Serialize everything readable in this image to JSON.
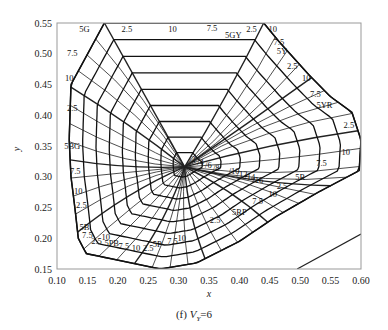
{
  "chart_data": {
    "type": "line",
    "title": "",
    "caption_prefix": "(f)",
    "caption_var": "V",
    "caption_sub": "Y",
    "caption_suffix": "=6",
    "xlabel": "x",
    "ylabel": "y",
    "xlim": [
      0.1,
      0.6
    ],
    "ylim": [
      0.15,
      0.55
    ],
    "x_ticks": [
      "0.10",
      "0.15",
      "0.20",
      "0.25",
      "0.30",
      "0.35",
      "0.40",
      "0.45",
      "0.50",
      "0.55",
      "0.60"
    ],
    "y_ticks": [
      "0.15",
      "0.20",
      "0.25",
      "0.30",
      "0.35",
      "0.40",
      "0.45",
      "0.50",
      "0.55"
    ],
    "grid": false,
    "white_point": {
      "x": 0.31,
      "y": 0.316
    },
    "chroma_labels": [
      "/2",
      "/4",
      "/6",
      "/8",
      "/10",
      "/12",
      "/14",
      "/16"
    ],
    "hue_labels": [
      {
        "text": "5G",
        "x": 0.145,
        "y": 0.535
      },
      {
        "text": "7.5",
        "x": 0.125,
        "y": 0.497
      },
      {
        "text": "10",
        "x": 0.12,
        "y": 0.456
      },
      {
        "text": "2.5",
        "x": 0.125,
        "y": 0.407
      },
      {
        "text": "5BG",
        "x": 0.125,
        "y": 0.345
      },
      {
        "text": "7.5",
        "x": 0.13,
        "y": 0.305
      },
      {
        "text": "10",
        "x": 0.135,
        "y": 0.272
      },
      {
        "text": "2.5",
        "x": 0.14,
        "y": 0.25
      },
      {
        "text": "5B",
        "x": 0.145,
        "y": 0.213
      },
      {
        "text": "7.5",
        "x": 0.15,
        "y": 0.2
      },
      {
        "text": "2.5",
        "x": 0.165,
        "y": 0.19
      },
      {
        "text": "10",
        "x": 0.18,
        "y": 0.197
      },
      {
        "text": "5PB",
        "x": 0.19,
        "y": 0.187
      },
      {
        "text": "7.5",
        "x": 0.21,
        "y": 0.183
      },
      {
        "text": "10",
        "x": 0.23,
        "y": 0.18
      },
      {
        "text": "2.5",
        "x": 0.25,
        "y": 0.18
      },
      {
        "text": "5P",
        "x": 0.265,
        "y": 0.185
      },
      {
        "text": "7.5",
        "x": 0.29,
        "y": 0.19
      },
      {
        "text": "10",
        "x": 0.305,
        "y": 0.195
      },
      {
        "text": "2.5",
        "x": 0.36,
        "y": 0.225
      },
      {
        "text": "5RP",
        "x": 0.4,
        "y": 0.238
      },
      {
        "text": "7.5",
        "x": 0.43,
        "y": 0.255
      },
      {
        "text": "10",
        "x": 0.455,
        "y": 0.267
      },
      {
        "text": "2.5",
        "x": 0.47,
        "y": 0.28
      },
      {
        "text": "5R",
        "x": 0.5,
        "y": 0.295
      },
      {
        "text": "7.5",
        "x": 0.535,
        "y": 0.318
      },
      {
        "text": "10",
        "x": 0.575,
        "y": 0.335
      },
      {
        "text": "2.5",
        "x": 0.58,
        "y": 0.38
      },
      {
        "text": "5YR",
        "x": 0.54,
        "y": 0.412
      },
      {
        "text": "7.5",
        "x": 0.525,
        "y": 0.43
      },
      {
        "text": "10",
        "x": 0.51,
        "y": 0.455
      },
      {
        "text": "2.5",
        "x": 0.487,
        "y": 0.475
      },
      {
        "text": "5Y",
        "x": 0.47,
        "y": 0.5
      },
      {
        "text": "7.5",
        "x": 0.465,
        "y": 0.515
      },
      {
        "text": "10",
        "x": 0.455,
        "y": 0.535
      },
      {
        "text": "2.5",
        "x": 0.42,
        "y": 0.535
      },
      {
        "text": "5GY",
        "x": 0.39,
        "y": 0.525
      },
      {
        "text": "7.5",
        "x": 0.355,
        "y": 0.537
      },
      {
        "text": "10",
        "x": 0.29,
        "y": 0.535
      },
      {
        "text": "2.5",
        "x": 0.215,
        "y": 0.535
      }
    ],
    "extra_line": {
      "from": {
        "x": 0.495,
        "y": 0.15
      },
      "to": {
        "x": 0.6,
        "y": 0.207
      }
    }
  }
}
